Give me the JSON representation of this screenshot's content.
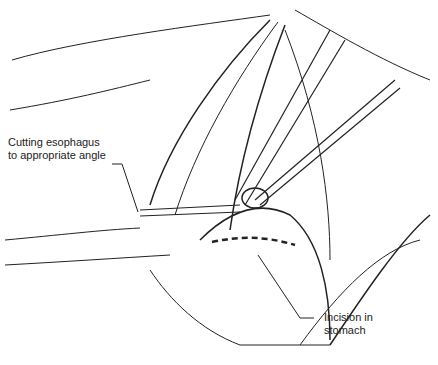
{
  "figure": {
    "type": "surgical illustration",
    "labels": [
      {
        "id": "esophagus",
        "line1": "Cutting esophagus",
        "line2": "to appropriate angle"
      },
      {
        "id": "incision",
        "line1": "Incision in",
        "line2": "stomach"
      }
    ]
  }
}
